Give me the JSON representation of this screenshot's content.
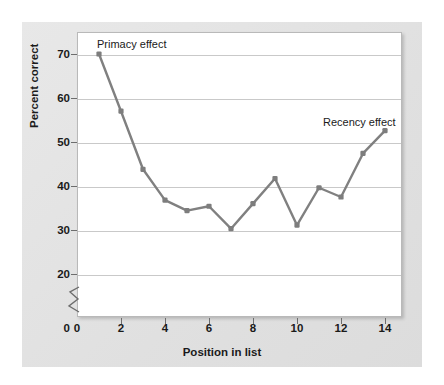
{
  "chart_data": {
    "type": "line",
    "title": "",
    "xlabel": "Position in list",
    "ylabel": "Percent correct",
    "xlim": [
      0,
      15
    ],
    "ylim": [
      18,
      74
    ],
    "grid": true,
    "legend": "none",
    "y_axis_break": true,
    "y_axis_break_note": "axis broken between 0 and 20",
    "xticks": [
      0,
      2,
      4,
      6,
      8,
      10,
      12,
      14
    ],
    "yticks": [
      20,
      30,
      40,
      50,
      60,
      70
    ],
    "x": [
      1,
      2,
      3,
      4,
      5,
      6,
      7,
      8,
      9,
      10,
      11,
      12,
      13,
      14
    ],
    "categories": [
      "1",
      "2",
      "3",
      "4",
      "5",
      "6",
      "7",
      "8",
      "9",
      "10",
      "11",
      "12",
      "13",
      "14"
    ],
    "series": [
      {
        "name": "Percent correct",
        "color": "#808080",
        "values": [
          70.0,
          57.0,
          43.8,
          36.8,
          34.4,
          35.4,
          30.3,
          36.0,
          41.7,
          31.1,
          39.6,
          37.5,
          47.4,
          52.6
        ]
      }
    ],
    "annotations": [
      {
        "label": "Primacy effect",
        "near_x": 1,
        "near_y": 70.0
      },
      {
        "label": "Recency effect",
        "near_x": 14,
        "near_y": 52.6
      }
    ]
  },
  "axis": {
    "ylabel": "Percent correct",
    "xlabel": "Position in list",
    "ytick_labels": [
      "70",
      "60",
      "50",
      "40",
      "30",
      "20",
      "0"
    ],
    "xtick_labels": [
      "0",
      "2",
      "4",
      "6",
      "8",
      "10",
      "12",
      "14"
    ]
  },
  "annotations": {
    "primacy": "Primacy effect",
    "recency": "Recency effect"
  },
  "colors": {
    "line": "#808080",
    "marker": "#7d7d7d",
    "grid": "#c9c9c9",
    "panel_background": "#e3e3e3",
    "plot_background": "#ffffff",
    "text": "#1a1a1a"
  }
}
